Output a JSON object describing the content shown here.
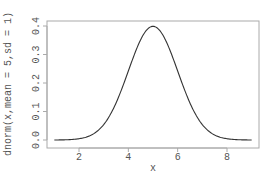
{
  "chart_data": {
    "type": "line",
    "title": "",
    "xlabel": "x",
    "ylabel": "dnorm(x,mean = 5,sd = 1)",
    "xlim": [
      1,
      9
    ],
    "ylim": [
      0,
      0.4
    ],
    "x_ticks": [
      2,
      4,
      6,
      8
    ],
    "x_tick_labels": [
      "2",
      "4",
      "6",
      "8"
    ],
    "y_ticks": [
      0.0,
      0.1,
      0.2,
      0.3,
      0.4
    ],
    "y_tick_labels": [
      "0.0",
      "0.1",
      "0.2",
      "0.3",
      "0.4"
    ],
    "grid": false,
    "legend": null,
    "series": [
      {
        "name": "dnorm(x, mean = 5, sd = 1)",
        "function": "normal_pdf",
        "mean": 5,
        "sd": 1,
        "x": [
          1,
          1.5,
          2,
          2.5,
          3,
          3.5,
          4,
          4.5,
          5,
          5.5,
          6,
          6.5,
          7,
          7.5,
          8,
          8.5,
          9
        ],
        "values": [
          0.0001,
          0.0009,
          0.0044,
          0.0175,
          0.054,
          0.1295,
          0.242,
          0.3521,
          0.3989,
          0.3521,
          0.242,
          0.1295,
          0.054,
          0.0175,
          0.0044,
          0.0009,
          0.0001
        ]
      }
    ]
  },
  "colors": {
    "line": "#333333",
    "axis": "#999999",
    "text": "#555555",
    "background": "#ffffff"
  }
}
